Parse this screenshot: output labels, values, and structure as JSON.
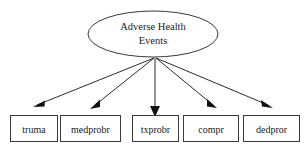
{
  "diagram": {
    "type": "path-diagram",
    "title_node": {
      "label_line_1": "Adverse Health",
      "label_line_2": "Events",
      "shape": "ellipse"
    },
    "indicators": [
      {
        "label": "truma",
        "shape": "rectangle"
      },
      {
        "label": "medprobr",
        "shape": "rectangle"
      },
      {
        "label": "txprobr",
        "shape": "rectangle"
      },
      {
        "label": "compr",
        "shape": "rectangle"
      },
      {
        "label": "dedpror",
        "shape": "rectangle"
      }
    ],
    "edges": [
      {
        "from": "Adverse Health Events",
        "to": "truma"
      },
      {
        "from": "Adverse Health Events",
        "to": "medprobr"
      },
      {
        "from": "Adverse Health Events",
        "to": "txprobr"
      },
      {
        "from": "Adverse Health Events",
        "to": "compr"
      },
      {
        "from": "Adverse Health Events",
        "to": "dedpror"
      }
    ],
    "colors": {
      "background": "#ffffff",
      "stroke": "#3a3a3a",
      "edge": "#2b2b2b",
      "text": "#1a1a1a"
    }
  }
}
